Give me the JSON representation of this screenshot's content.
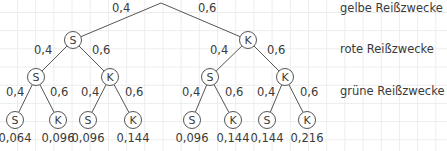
{
  "diagram": {
    "type": "probability-tree",
    "level_labels": [
      "gelbe Reißzwecke",
      "rote Reißzwecke",
      "grüne Reißzwecke"
    ],
    "root": {
      "x": 161,
      "y": 3
    },
    "nodes": [
      {
        "id": "n1",
        "label": "S",
        "x": 73,
        "y": 40,
        "parent": "root",
        "edge_prob": "0,4",
        "edge_label_x": 112,
        "edge_label_y": 12
      },
      {
        "id": "n2",
        "label": "K",
        "x": 248,
        "y": 40,
        "parent": "root",
        "edge_prob": "0,6",
        "edge_label_x": 198,
        "edge_label_y": 12
      },
      {
        "id": "n11",
        "label": "S",
        "x": 36,
        "y": 77,
        "parent": "n1",
        "edge_prob": "0,4",
        "edge_label_x": 34,
        "edge_label_y": 54
      },
      {
        "id": "n12",
        "label": "K",
        "x": 110,
        "y": 77,
        "parent": "n1",
        "edge_prob": "0,6",
        "edge_label_x": 92,
        "edge_label_y": 54
      },
      {
        "id": "n21",
        "label": "S",
        "x": 210,
        "y": 77,
        "parent": "n2",
        "edge_prob": "0,4",
        "edge_label_x": 210,
        "edge_label_y": 54
      },
      {
        "id": "n22",
        "label": "K",
        "x": 285,
        "y": 77,
        "parent": "n2",
        "edge_prob": "0,6",
        "edge_label_x": 267,
        "edge_label_y": 54
      },
      {
        "id": "n111",
        "label": "S",
        "x": 15,
        "y": 120,
        "parent": "n11",
        "edge_prob": "0,4",
        "edge_label_x": 6,
        "edge_label_y": 96,
        "result": "0,064"
      },
      {
        "id": "n112",
        "label": "K",
        "x": 58,
        "y": 120,
        "parent": "n11",
        "edge_prob": "0,6",
        "edge_label_x": 50,
        "edge_label_y": 96,
        "result": "0,096"
      },
      {
        "id": "n121",
        "label": "S",
        "x": 88,
        "y": 120,
        "parent": "n12",
        "edge_prob": "0,4",
        "edge_label_x": 81,
        "edge_label_y": 96,
        "result": "0,096"
      },
      {
        "id": "n122",
        "label": "K",
        "x": 133,
        "y": 120,
        "parent": "n12",
        "edge_prob": "0,6",
        "edge_label_x": 125,
        "edge_label_y": 96,
        "result": "0,144"
      },
      {
        "id": "n211",
        "label": "S",
        "x": 192,
        "y": 120,
        "parent": "n21",
        "edge_prob": "0,4",
        "edge_label_x": 182,
        "edge_label_y": 96,
        "result": "0,096"
      },
      {
        "id": "n212",
        "label": "K",
        "x": 233,
        "y": 120,
        "parent": "n21",
        "edge_prob": "0,6",
        "edge_label_x": 225,
        "edge_label_y": 96,
        "result": "0,144"
      },
      {
        "id": "n221",
        "label": "S",
        "x": 267,
        "y": 120,
        "parent": "n22",
        "edge_prob": "0,4",
        "edge_label_x": 257,
        "edge_label_y": 96,
        "result": "0,144"
      },
      {
        "id": "n222",
        "label": "K",
        "x": 307,
        "y": 120,
        "parent": "n22",
        "edge_prob": "0,6",
        "edge_label_x": 300,
        "edge_label_y": 96,
        "result": "0,216"
      }
    ],
    "colors": {
      "line": "#555555",
      "text": "#3a3a3a",
      "grid": "#ececec"
    }
  }
}
